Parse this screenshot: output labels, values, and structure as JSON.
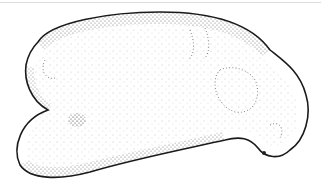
{
  "image": {
    "subject": "stippled illustration of an embryo",
    "style": "black ink stipple on white",
    "colors": {
      "ink": "#1a1a1a",
      "background": "#ffffff",
      "frame_line": "#dcdcdc"
    }
  }
}
